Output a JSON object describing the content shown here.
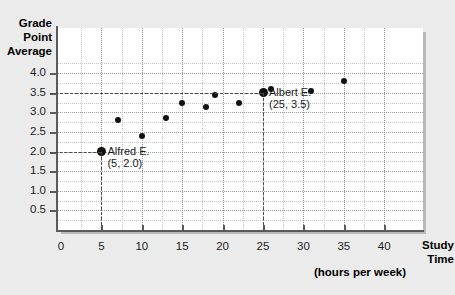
{
  "chart_data": {
    "type": "scatter",
    "title": "",
    "xlabel": "Study Time",
    "xlabel_sub": "(hours per week)",
    "ylabel_lines": [
      "Grade",
      "Point",
      "Average"
    ],
    "xlim": [
      0,
      42
    ],
    "ylim": [
      0,
      4.4
    ],
    "grid": true,
    "legend": "none",
    "x_ticks": [
      0,
      5,
      10,
      15,
      20,
      25,
      30,
      35,
      40
    ],
    "x_tick_labels": [
      "0",
      "5",
      "10",
      "15",
      "20",
      "25",
      "30",
      "35",
      "40"
    ],
    "y_ticks": [
      0.5,
      1.0,
      1.5,
      2.0,
      2.5,
      3.0,
      3.5,
      4.0
    ],
    "y_tick_labels": [
      "0.5",
      "1.0",
      "1.5",
      "2.0",
      "2.5",
      "3.0",
      "3.5",
      "4.0"
    ],
    "y_minor_gridlines": [
      4.25,
      3.75,
      3.25,
      2.75,
      2.25,
      1.75,
      1.25,
      0.75,
      0.25
    ],
    "x_minor_gridlines": [
      2.5,
      7.5,
      12.5,
      17.5,
      22.5,
      27.5,
      32.5,
      37.5
    ],
    "points": [
      {
        "x": 5,
        "y": 2.0,
        "highlight": true
      },
      {
        "x": 7,
        "y": 2.8,
        "highlight": false
      },
      {
        "x": 10,
        "y": 2.4,
        "highlight": false
      },
      {
        "x": 13,
        "y": 2.85,
        "highlight": false
      },
      {
        "x": 15,
        "y": 3.25,
        "highlight": false
      },
      {
        "x": 18,
        "y": 3.15,
        "highlight": false
      },
      {
        "x": 19,
        "y": 3.45,
        "highlight": false
      },
      {
        "x": 22,
        "y": 3.25,
        "highlight": false
      },
      {
        "x": 25,
        "y": 3.5,
        "highlight": true
      },
      {
        "x": 26,
        "y": 3.6,
        "highlight": false
      },
      {
        "x": 31,
        "y": 3.55,
        "highlight": false
      },
      {
        "x": 35,
        "y": 3.8,
        "highlight": false
      }
    ],
    "annotations": [
      {
        "name": "alfred",
        "label_line1": "Alfred E.",
        "label_line2": "(5, 2.0)",
        "x": 5,
        "y": 2.0
      },
      {
        "name": "albert",
        "label_line1": "Albert E.",
        "label_line2": "(25, 3.5)",
        "x": 25,
        "y": 3.5
      }
    ],
    "colors": {
      "point": "#111111",
      "axis": "#5a5a5a",
      "grid_major": "#9a9a9a",
      "grid_minor": "#c2c2c2",
      "guide": "#4a4a4a",
      "plot_bg": "#ffffff",
      "page_bg": "#ebebeb",
      "text": "#1b1b1b"
    }
  }
}
